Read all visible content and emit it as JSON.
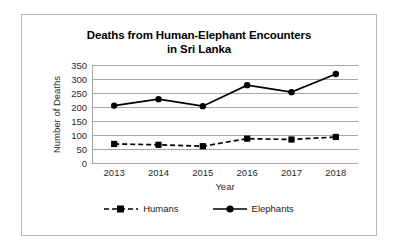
{
  "chart_data": {
    "type": "line",
    "title": "Deaths from Human-Elephant Encounters in Sri Lanka",
    "title_lines": [
      "Deaths from Human-Elephant Encounters",
      "in Sri Lanka"
    ],
    "xlabel": "Year",
    "ylabel": "Number of Deaths",
    "categories": [
      "2013",
      "2014",
      "2015",
      "2016",
      "2017",
      "2018"
    ],
    "x": [
      2013,
      2014,
      2015,
      2016,
      2017,
      2018
    ],
    "ylim": [
      0,
      350
    ],
    "yticks": [
      "0",
      "50",
      "100",
      "150",
      "200",
      "250",
      "300",
      "350"
    ],
    "ytick_values": [
      0,
      50,
      100,
      150,
      200,
      250,
      300,
      350
    ],
    "grid": "horizontal",
    "legend_position": "bottom",
    "series": [
      {
        "name": "Humans",
        "values": [
          68,
          65,
          60,
          87,
          84,
          93
        ],
        "line_style": "dashed",
        "marker": "square",
        "color": "#000000"
      },
      {
        "name": "Elephants",
        "values": [
          205,
          228,
          203,
          278,
          253,
          318
        ],
        "line_style": "solid",
        "marker": "circle",
        "color": "#000000"
      }
    ]
  },
  "style": {
    "gridline_color": "#a6a6a6",
    "frame_color": "#b8b8b8",
    "background": "#ffffff",
    "text_color": "#2a2a2a"
  }
}
